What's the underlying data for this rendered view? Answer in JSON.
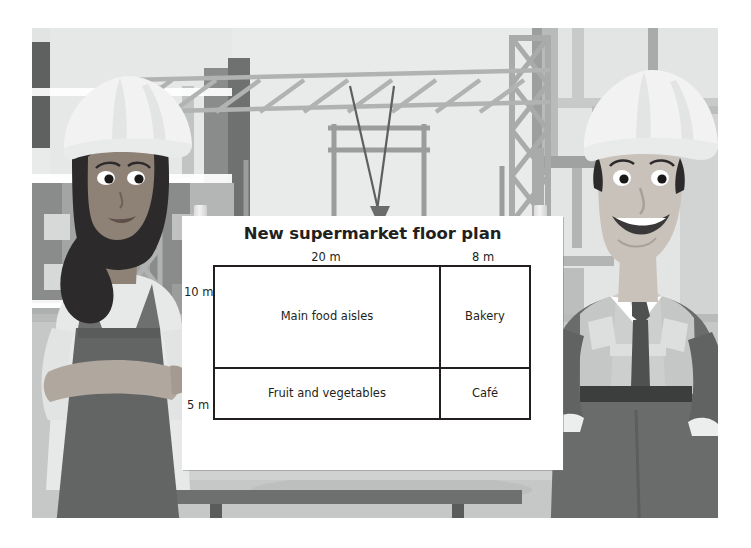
{
  "scene": {
    "description": "construction-site illustration with two workers presenting a whiteboard",
    "palette": {
      "sky": "#e9eaea",
      "building_light": "#e2e3e3",
      "building_mid": "#c9cbcb",
      "building_dark": "#9b9d9d",
      "steel": "#a7a9a9",
      "ground": "#c6c8c8",
      "board_white": "#ffffff",
      "ink": "#231f20",
      "ledge": "#6e7070",
      "helmet": "#f2f2f2",
      "skin_light": "#c9c2bb",
      "skin_dark": "#8e8176",
      "hair_dark": "#2c2a2a",
      "overalls": "#636565",
      "suit": "#6a6c6c",
      "vest": "#c5c7c7",
      "tie": "#4f5151"
    }
  },
  "board": {
    "title": "New supermarket floor plan",
    "dimensions": {
      "top_left": "20 m",
      "top_right": "8 m",
      "left_upper": "10 m",
      "left_lower": "5 m"
    },
    "plan": {
      "columns": [
        "20 m",
        "8 m"
      ],
      "rows": [
        "10 m",
        "5 m"
      ],
      "cells": [
        [
          "Main food aisles",
          "Bakery"
        ],
        [
          "Fruit and vegetables",
          "Café"
        ]
      ]
    },
    "clips": [
      "magnet-clip-left",
      "magnet-clip-right"
    ]
  },
  "figures": {
    "left": {
      "name": "female-construction-worker",
      "helmet": "white hard hat",
      "pose": "arms folded"
    },
    "right": {
      "name": "male-construction-worker",
      "helmet": "white hard hat",
      "pose": "hands in pockets",
      "wearing": "hi-vis vest, shirt and tie"
    }
  }
}
